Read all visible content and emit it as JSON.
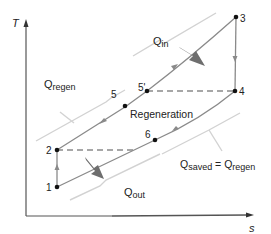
{
  "diagram": {
    "type": "T-s diagram (regenerative Brayton cycle)",
    "axes": {
      "y_label": "T",
      "x_label": "s"
    },
    "points": [
      {
        "id": "1",
        "label": "1"
      },
      {
        "id": "2",
        "label": "2"
      },
      {
        "id": "3",
        "label": "3"
      },
      {
        "id": "4",
        "label": "4"
      },
      {
        "id": "5",
        "label": "5"
      },
      {
        "id": "5p",
        "label": "5'"
      },
      {
        "id": "6",
        "label": "6"
      }
    ],
    "annotations": {
      "q_in": {
        "main": "Q",
        "sub": "in"
      },
      "q_regen": {
        "main": "Q",
        "sub": "regen"
      },
      "q_out": {
        "main": "Q",
        "sub": "out"
      },
      "regeneration": "Regeneration",
      "q_saved": {
        "main": "Q",
        "sub": "saved",
        "eq": " = ",
        "main2": "Q",
        "sub2": "regen"
      }
    },
    "colors": {
      "axis": "#555555",
      "cycle_line": "#8a8a8a",
      "bracket": "#cfcfcf",
      "dashed": "#8a8a8a",
      "heat_arrow": "#6e6e6e",
      "point": "#111111"
    }
  }
}
